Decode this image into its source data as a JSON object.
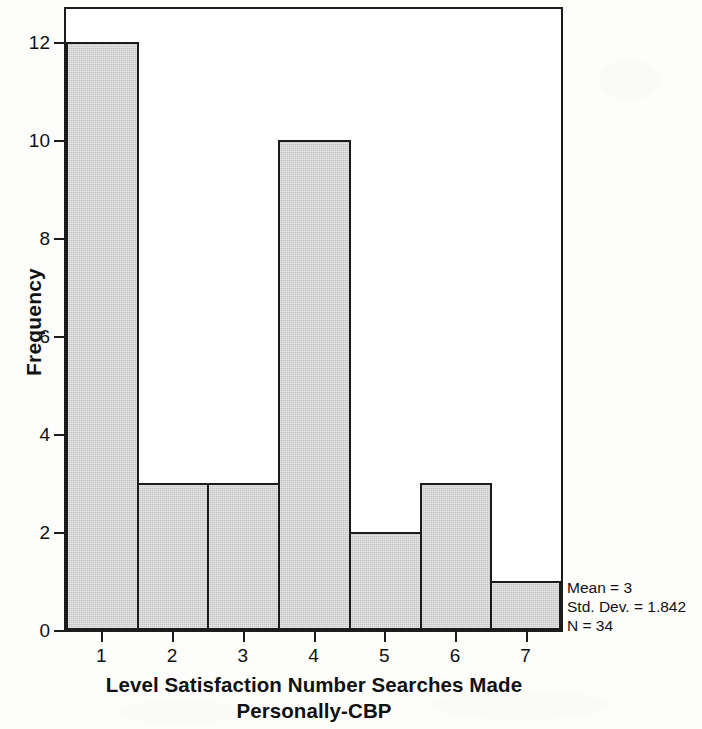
{
  "chart_data": {
    "type": "bar",
    "title": "",
    "xlabel": "Level Satisfaction Number Searches Made Personally-CBP",
    "xlabel_lines": [
      "Level Satisfaction Number Searches Made",
      "Personally-CBP"
    ],
    "ylabel": "Frequency",
    "categories": [
      "1",
      "2",
      "3",
      "4",
      "5",
      "6",
      "7"
    ],
    "values": [
      12,
      3,
      3,
      10,
      2,
      3,
      1
    ],
    "xticks": [
      "1",
      "2",
      "3",
      "4",
      "5",
      "6",
      "7"
    ],
    "yticks": [
      "0",
      "2",
      "4",
      "6",
      "8",
      "10",
      "12"
    ],
    "ytick_values": [
      0,
      2,
      4,
      6,
      8,
      10,
      12
    ],
    "ylim": [
      0,
      12.67
    ],
    "xlim": [
      0.5,
      7.5
    ],
    "grid": false,
    "legend": null,
    "bar_fill_color": "#d2d2d2",
    "bar_edge_color": "#1b1b1b",
    "frame_color": "#1c1c1c",
    "background_color": "#ffffff",
    "annotations": {
      "mean_label": "Mean = 3",
      "std_dev_label": "Std. Dev. = 1.842",
      "n_label": "N = 34",
      "mean": 3,
      "std_dev": 1.842,
      "n": 34
    }
  }
}
